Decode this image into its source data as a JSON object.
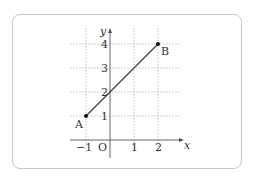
{
  "figure": {
    "axes": {
      "x_label": "x",
      "y_label": "y",
      "origin_label": "O",
      "x_ticks": [
        {
          "value": -1,
          "label": "−1"
        },
        {
          "value": 1,
          "label": "1"
        },
        {
          "value": 2,
          "label": "2"
        }
      ],
      "y_ticks": [
        {
          "value": 1,
          "label": "1"
        },
        {
          "value": 2,
          "label": "2"
        },
        {
          "value": 3,
          "label": "3"
        },
        {
          "value": 4,
          "label": "4"
        }
      ]
    },
    "grid": "dotted",
    "points": [
      {
        "name": "A",
        "x": -1,
        "y": 1
      },
      {
        "name": "B",
        "x": 2,
        "y": 4
      }
    ],
    "segment": {
      "from": "A",
      "to": "B"
    },
    "colors": {
      "grid": "#b0b0b0",
      "axis": "#555555",
      "line": "#333333",
      "border": "#c8c8c8"
    }
  }
}
